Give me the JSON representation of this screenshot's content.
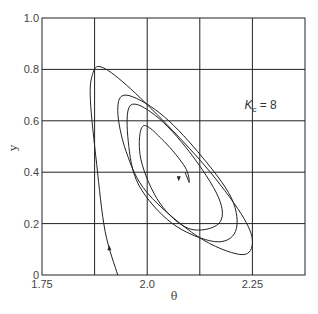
{
  "chart_data": {
    "type": "line",
    "title": "",
    "xlabel": "θ",
    "ylabel": "y",
    "xlim": [
      1.75,
      2.375
    ],
    "ylim": [
      0,
      1.0
    ],
    "grid": true,
    "x_ticks": [
      "1.75",
      "2.0",
      "2.25"
    ],
    "y_ticks": [
      "0",
      "0.2",
      "0.4",
      "0.6",
      "0.8",
      "1.0"
    ],
    "annotation": {
      "text_main": "K",
      "text_sub": "c",
      "text_rest": " = 8",
      "x": 2.25,
      "y": 0.66
    },
    "series": [
      {
        "name": "phase trajectory (spiral toward limit cycle / focus)",
        "x": [
          1.93,
          1.9,
          1.88,
          1.865,
          1.87,
          1.89,
          1.95,
          2.05,
          2.15,
          2.23,
          2.25,
          2.22,
          2.12,
          2.0,
          1.95,
          1.93,
          1.95,
          2.03,
          2.12,
          2.2,
          2.21,
          2.16,
          2.06,
          1.98,
          1.955,
          1.96,
          2.02,
          2.1,
          2.17,
          2.17,
          2.1,
          2.03,
          1.985,
          1.99,
          2.04,
          2.09,
          2.1,
          2.09
        ],
        "y": [
          0.0,
          0.17,
          0.43,
          0.68,
          0.78,
          0.81,
          0.74,
          0.58,
          0.4,
          0.22,
          0.12,
          0.08,
          0.15,
          0.32,
          0.48,
          0.64,
          0.7,
          0.63,
          0.48,
          0.3,
          0.17,
          0.13,
          0.2,
          0.35,
          0.52,
          0.66,
          0.62,
          0.48,
          0.3,
          0.2,
          0.18,
          0.28,
          0.45,
          0.58,
          0.52,
          0.42,
          0.36,
          0.4
        ]
      }
    ],
    "arrows": [
      {
        "x": 1.91,
        "y": 0.1,
        "direction": "up"
      },
      {
        "x": 2.075,
        "y": 0.38,
        "direction": "down"
      }
    ]
  }
}
